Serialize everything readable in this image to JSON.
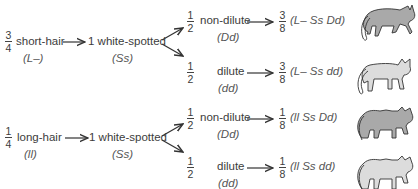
{
  "diagram": {
    "title": "",
    "groups": [
      {
        "fraction": {
          "num": "3",
          "den": "4"
        },
        "phenotype": "short-hair",
        "genotype": "(L–)",
        "middle": {
          "label": "1 white-spotted",
          "genotype": "(Ss)"
        },
        "branches": [
          {
            "fraction": {
              "num": "1",
              "den": "2"
            },
            "label": "non-dilute",
            "genotype": "(Dd)",
            "result": {
              "fraction": {
                "num": "3",
                "den": "8"
              },
              "genotype": "(L–  Ss  Dd)"
            },
            "cat": {
              "hair": "short",
              "color": "#a9a9a9",
              "icon": "short-hair-dark-cat-icon"
            }
          },
          {
            "fraction": {
              "num": "1",
              "den": "2"
            },
            "label": "dilute",
            "genotype": "(dd)",
            "result": {
              "fraction": {
                "num": "3",
                "den": "8"
              },
              "genotype": "(L–  Ss  dd)"
            },
            "cat": {
              "hair": "short",
              "color": "#dcdcdc",
              "icon": "short-hair-light-cat-icon"
            }
          }
        ]
      },
      {
        "fraction": {
          "num": "1",
          "den": "4"
        },
        "phenotype": "long-hair",
        "genotype": "(ll)",
        "middle": {
          "label": "1 white-spotted",
          "genotype": "(Ss)"
        },
        "branches": [
          {
            "fraction": {
              "num": "1",
              "den": "2"
            },
            "label": "non-dilute",
            "genotype": "(Dd)",
            "result": {
              "fraction": {
                "num": "1",
                "den": "8"
              },
              "genotype": "(ll  Ss  Dd)"
            },
            "cat": {
              "hair": "long",
              "color": "#a9a9a9",
              "icon": "long-hair-dark-cat-icon"
            }
          },
          {
            "fraction": {
              "num": "1",
              "den": "2"
            },
            "label": "dilute",
            "genotype": "(dd)",
            "result": {
              "fraction": {
                "num": "1",
                "den": "8"
              },
              "genotype": "(ll  Ss  dd)"
            },
            "cat": {
              "hair": "long",
              "color": "#dcdcdc",
              "icon": "long-hair-light-cat-icon"
            }
          }
        ]
      }
    ]
  }
}
